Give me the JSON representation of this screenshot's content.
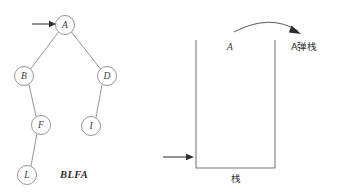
{
  "figure": {
    "background_color": "#ffffff",
    "stroke_color": "#8a8a8a",
    "text_color": "#2e2e2e"
  },
  "tree": {
    "name": "binary-tree",
    "nodes": [
      {
        "id": "A",
        "label": "A",
        "cx": 65,
        "cy": 25,
        "r": 9.5
      },
      {
        "id": "B",
        "label": "B",
        "cx": 24,
        "cy": 76,
        "r": 9.5
      },
      {
        "id": "D",
        "label": "D",
        "cx": 107,
        "cy": 76,
        "r": 9.5
      },
      {
        "id": "F",
        "label": "F",
        "cx": 41,
        "cy": 125,
        "r": 9.5
      },
      {
        "id": "I",
        "label": "I",
        "cx": 91,
        "cy": 126,
        "r": 9.5
      },
      {
        "id": "L",
        "label": "L",
        "cx": 27,
        "cy": 175,
        "r": 9.5
      }
    ],
    "edges": [
      {
        "from": "A",
        "to": "B"
      },
      {
        "from": "A",
        "to": "D"
      },
      {
        "from": "B",
        "to": "F"
      },
      {
        "from": "D",
        "to": "I"
      },
      {
        "from": "F",
        "to": "L"
      }
    ],
    "root_pointer": {
      "name": "root-pointer-arrow",
      "x1": 32,
      "y1": 24,
      "x2": 54,
      "y2": 24
    }
  },
  "sequence": {
    "label": "BLFA",
    "x": 60,
    "y": 178
  },
  "stack": {
    "name": "stack-container",
    "left": 196,
    "right": 275,
    "top": 40,
    "bottom": 168,
    "bottom_label": "栈",
    "bottom_label_x": 236,
    "bottom_label_y": 182,
    "push_pointer": {
      "name": "stack-input-arrow",
      "x1": 163,
      "y1": 157,
      "x2": 190,
      "y2": 157
    },
    "top_item": {
      "label": "A",
      "x": 230,
      "y": 50
    },
    "pop_arrow": {
      "name": "pop-curve-arrow",
      "path": "M 236 31 Q 272 14 300 33"
    },
    "pop_label": {
      "text": "A弹栈",
      "x": 298,
      "y": 50
    }
  }
}
